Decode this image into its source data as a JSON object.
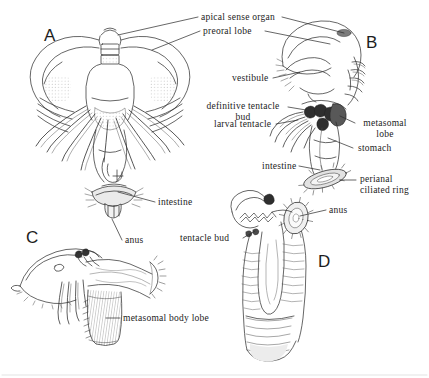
{
  "figure": {
    "background_color": "#ffffff",
    "ink_color": "#2b2b2b",
    "width": 429,
    "height": 378
  },
  "panels": [
    {
      "id": "A",
      "letter": "A",
      "description": "Frontal view of larva with broad preoral lobe, apical sense organ and larval tentacles"
    },
    {
      "id": "B",
      "letter": "B",
      "description": "Lateral view of larva showing vestibule, stomach, intestine and perianal ciliated ring"
    },
    {
      "id": "C",
      "letter": "C",
      "description": "Lateral view of metamorphosing juvenile with metasomal body lobe"
    },
    {
      "id": "D",
      "letter": "D",
      "description": "Elongated juvenile with tentacle bud and anus"
    }
  ],
  "labels": [
    {
      "id": "apical-sense-organ",
      "text": "apical sense organ",
      "lines": [
        "apical sense organ"
      ]
    },
    {
      "id": "preoral-lobe",
      "text": "preoral lobe",
      "lines": [
        "preoral lobe"
      ]
    },
    {
      "id": "vestibule",
      "text": "vestibule",
      "lines": [
        "vestibule"
      ]
    },
    {
      "id": "definitive-tentacle-bud",
      "text": "definitive tentacle bud",
      "lines": [
        "definitive tentacle",
        "bud"
      ]
    },
    {
      "id": "larval-tentacle",
      "text": "larval tentacle",
      "lines": [
        "larval tentacle"
      ]
    },
    {
      "id": "metasomal-lobe",
      "text": "metasomal lobe",
      "lines": [
        "metasomal",
        "lobe"
      ]
    },
    {
      "id": "stomach",
      "text": "stomach",
      "lines": [
        "stomach"
      ]
    },
    {
      "id": "intestine-b",
      "text": "intestine",
      "lines": [
        "intestine"
      ]
    },
    {
      "id": "perianal-ciliated-ring",
      "text": "perianal ciliated ring",
      "lines": [
        "perianal",
        "ciliated ring"
      ]
    },
    {
      "id": "intestine-a",
      "text": "intestine",
      "lines": [
        "intestine"
      ]
    },
    {
      "id": "anus-a",
      "text": "anus",
      "lines": [
        "anus"
      ]
    },
    {
      "id": "tentacle-bud",
      "text": "tentacle bud",
      "lines": [
        "tentacle bud"
      ]
    },
    {
      "id": "anus-d",
      "text": "anus",
      "lines": [
        "anus"
      ]
    },
    {
      "id": "metasomal-body-lobe",
      "text": "metasomal body lobe",
      "lines": [
        "metasomal body lobe"
      ]
    }
  ],
  "label_text": {
    "apical_sense_organ": "apical sense organ",
    "preoral_lobe": "preoral lobe",
    "vestibule": "vestibule",
    "definitive_tentacle_1": "definitive tentacle",
    "definitive_tentacle_2": "bud",
    "larval_tentacle": "larval tentacle",
    "metasomal_1": "metasomal",
    "metasomal_2": "lobe",
    "stomach": "stomach",
    "intestine_b": "intestine",
    "perianal_1": "perianal",
    "perianal_2": "ciliated ring",
    "intestine_a": "intestine",
    "anus_a": "anus",
    "tentacle_bud": "tentacle bud",
    "anus_d": "anus",
    "metasomal_body_lobe": "metasomal body lobe"
  },
  "panel_letters": {
    "a": "A",
    "b": "B",
    "c": "C",
    "d": "D"
  }
}
